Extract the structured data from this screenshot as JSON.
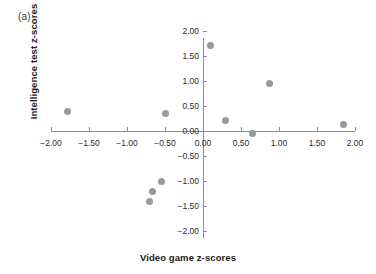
{
  "panel": {
    "label": "(a)"
  },
  "colors": {
    "point": "#9a9a9a",
    "axis": "#8d8d8d",
    "text": "#1c1c1c"
  },
  "chart_data": {
    "type": "scatter",
    "title": "",
    "panel_label": "(a)",
    "xlabel": "Video game z-scores",
    "ylabel": "Intelligence test z-scores",
    "xlim": [
      -2.0,
      2.0
    ],
    "ylim": [
      -2.0,
      2.0
    ],
    "grid": false,
    "legend": null,
    "xticks": [
      "-2.00",
      "-1.50",
      "-1.00",
      "-0.50",
      "0.00",
      "0.50",
      "1.00",
      "1.50",
      "2.00"
    ],
    "xtick_values": [
      -2.0,
      -1.5,
      -1.0,
      -0.5,
      0.0,
      0.5,
      1.0,
      1.5,
      2.0
    ],
    "yticks": [
      "2.00",
      "1.50",
      "1.00",
      "0.50",
      "0.00",
      "-0.50",
      "-1.00",
      "-1.50",
      "-2.00"
    ],
    "ytick_values": [
      2.0,
      1.5,
      1.0,
      0.5,
      0.0,
      -0.5,
      -1.0,
      -1.5,
      -2.0
    ],
    "points": [
      {
        "x": -1.78,
        "y": 0.4
      },
      {
        "x": -0.7,
        "y": -1.4
      },
      {
        "x": -0.67,
        "y": -1.2
      },
      {
        "x": -0.55,
        "y": -1.0
      },
      {
        "x": -0.5,
        "y": 0.35
      },
      {
        "x": 0.1,
        "y": 1.72
      },
      {
        "x": 0.3,
        "y": 0.22
      },
      {
        "x": 0.65,
        "y": -0.05
      },
      {
        "x": 0.88,
        "y": 0.95
      },
      {
        "x": 1.85,
        "y": 0.13
      }
    ],
    "n_points": 10
  }
}
